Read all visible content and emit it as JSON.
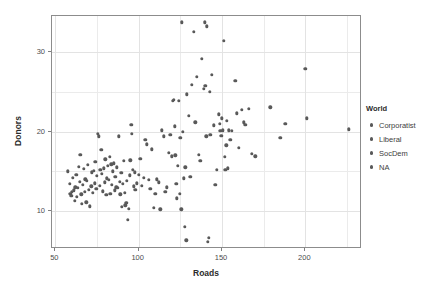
{
  "chart_data": {
    "type": "scatter",
    "title": "",
    "xlabel": "Roads",
    "ylabel": "Donors",
    "xlim": [
      48,
      234
    ],
    "ylim": [
      5.2,
      34.6
    ],
    "xticks": [
      50,
      100,
      150,
      200
    ],
    "yticks": [
      10,
      20,
      30
    ],
    "xticklabels": [
      "50",
      "100",
      "150",
      "200"
    ],
    "yticklabels": [
      "10",
      "20",
      "30"
    ],
    "grid": true,
    "grid_color": "#ebebeb",
    "point_color": "#595959",
    "panel_border_color": "#8c8c8c",
    "legend": {
      "title": "World",
      "position": "right",
      "entries": [
        {
          "label": "Corporatist",
          "color": "#595959"
        },
        {
          "label": "Liberal",
          "color": "#595959"
        },
        {
          "label": "SocDem",
          "color": "#595959"
        },
        {
          "label": "NA",
          "color": "#595959"
        }
      ]
    },
    "points": [
      [
        57.5,
        15.0
      ],
      [
        58.5,
        13.4
      ],
      [
        59.0,
        12.2
      ],
      [
        59.5,
        11.9
      ],
      [
        60.0,
        12.4
      ],
      [
        60.5,
        14.2
      ],
      [
        61.0,
        12.6
      ],
      [
        61.5,
        11.3
      ],
      [
        62.0,
        13.0
      ],
      [
        62.5,
        14.6
      ],
      [
        63.0,
        11.8
      ],
      [
        63.5,
        12.9
      ],
      [
        64.0,
        15.6
      ],
      [
        64.5,
        13.7
      ],
      [
        65.0,
        17.1
      ],
      [
        65.5,
        12.1
      ],
      [
        66.0,
        10.9
      ],
      [
        66.5,
        13.3
      ],
      [
        67.0,
        15.3
      ],
      [
        67.5,
        12.4
      ],
      [
        68.0,
        14.0
      ],
      [
        68.5,
        11.1
      ],
      [
        69.0,
        13.8
      ],
      [
        69.5,
        15.8
      ],
      [
        70.0,
        12.7
      ],
      [
        70.5,
        10.6
      ],
      [
        71.5,
        13.1
      ],
      [
        72.0,
        14.9
      ],
      [
        72.5,
        12.3
      ],
      [
        73.0,
        15.1
      ],
      [
        73.5,
        13.5
      ],
      [
        74.0,
        16.2
      ],
      [
        74.5,
        12.8
      ],
      [
        75.0,
        14.4
      ],
      [
        75.5,
        19.7
      ],
      [
        76.0,
        19.4
      ],
      [
        76.5,
        13.2
      ],
      [
        77.0,
        15.2
      ],
      [
        77.5,
        17.7
      ],
      [
        78.0,
        14.7
      ],
      [
        78.5,
        12.5
      ],
      [
        79.0,
        15.4
      ],
      [
        79.5,
        13.6
      ],
      [
        80.0,
        16.5
      ],
      [
        80.5,
        12.0
      ],
      [
        81.0,
        14.1
      ],
      [
        81.5,
        15.7
      ],
      [
        82.0,
        13.9
      ],
      [
        82.5,
        16.8
      ],
      [
        83.0,
        12.2
      ],
      [
        83.5,
        15.9
      ],
      [
        84.0,
        13.3
      ],
      [
        84.5,
        15.0
      ],
      [
        85.0,
        16.0
      ],
      [
        85.5,
        12.6
      ],
      [
        86.0,
        14.3
      ],
      [
        86.5,
        13.0
      ],
      [
        87.0,
        15.5
      ],
      [
        87.5,
        12.9
      ],
      [
        88.0,
        19.4
      ],
      [
        88.5,
        13.7
      ],
      [
        89.0,
        12.1
      ],
      [
        89.5,
        14.8
      ],
      [
        90.0,
        10.5
      ],
      [
        90.5,
        13.4
      ],
      [
        91.0,
        16.3
      ],
      [
        91.5,
        12.3
      ],
      [
        92.0,
        10.7
      ],
      [
        92.5,
        11.0
      ],
      [
        93.0,
        13.8
      ],
      [
        93.5,
        8.9
      ],
      [
        94.0,
        10.3
      ],
      [
        94.5,
        14.5
      ],
      [
        95.0,
        16.4
      ],
      [
        95.5,
        20.9
      ],
      [
        96.0,
        19.7
      ],
      [
        96.5,
        15.2
      ],
      [
        97.0,
        13.1
      ],
      [
        97.5,
        14.9
      ],
      [
        98.0,
        12.7
      ],
      [
        99.0,
        13.5
      ],
      [
        100.0,
        14.6
      ],
      [
        101.0,
        16.6
      ],
      [
        102.0,
        13.2
      ],
      [
        103.0,
        14.2
      ],
      [
        104.0,
        19.0
      ],
      [
        105.0,
        18.4
      ],
      [
        106.0,
        13.9
      ],
      [
        107.0,
        12.8
      ],
      [
        108.0,
        17.8
      ],
      [
        109.0,
        10.4
      ],
      [
        110.0,
        12.2
      ],
      [
        111.0,
        14.0
      ],
      [
        112.0,
        13.6
      ],
      [
        113.0,
        10.2
      ],
      [
        114.0,
        20.2
      ],
      [
        115.0,
        19.4
      ],
      [
        116.0,
        12.4
      ],
      [
        117.0,
        13.0
      ],
      [
        118.0,
        17.3
      ],
      [
        119.0,
        19.6
      ],
      [
        120.0,
        16.9
      ],
      [
        120.5,
        23.9
      ],
      [
        121.0,
        24.0
      ],
      [
        121.5,
        20.7
      ],
      [
        122.0,
        17.0
      ],
      [
        122.5,
        13.4
      ],
      [
        123.0,
        11.6
      ],
      [
        123.5,
        15.7
      ],
      [
        124.0,
        23.9
      ],
      [
        124.5,
        12.2
      ],
      [
        125.0,
        19.2
      ],
      [
        125.5,
        10.2
      ],
      [
        126.0,
        33.8
      ],
      [
        126.5,
        20.0
      ],
      [
        127.0,
        14.1
      ],
      [
        127.5,
        8.0
      ],
      [
        128.0,
        15.5
      ],
      [
        128.5,
        6.3
      ],
      [
        129.0,
        24.7
      ],
      [
        130.0,
        22.0
      ],
      [
        131.0,
        14.3
      ],
      [
        132.0,
        25.9
      ],
      [
        133.0,
        32.6
      ],
      [
        134.0,
        21.2
      ],
      [
        135.0,
        26.9
      ],
      [
        136.0,
        17.1
      ],
      [
        137.0,
        16.3
      ],
      [
        138.0,
        29.2
      ],
      [
        139.0,
        25.4
      ],
      [
        139.5,
        33.8
      ],
      [
        140.0,
        25.8
      ],
      [
        140.5,
        19.4
      ],
      [
        141.0,
        33.3
      ],
      [
        141.5,
        6.1
      ],
      [
        142.0,
        6.6
      ],
      [
        142.5,
        25.0
      ],
      [
        143.0,
        19.6
      ],
      [
        144.0,
        27.2
      ],
      [
        145.0,
        20.8
      ],
      [
        146.0,
        13.3
      ],
      [
        147.0,
        15.2
      ],
      [
        148.0,
        22.2
      ],
      [
        148.5,
        21.0
      ],
      [
        149.0,
        20.1
      ],
      [
        149.5,
        19.5
      ],
      [
        150.0,
        21.7
      ],
      [
        150.5,
        20.2
      ],
      [
        151.0,
        31.5
      ],
      [
        151.5,
        16.8
      ],
      [
        152.0,
        15.2
      ],
      [
        152.5,
        18.3
      ],
      [
        153.0,
        21.4
      ],
      [
        153.5,
        15.4
      ],
      [
        154.0,
        20.2
      ],
      [
        155.0,
        19.0
      ],
      [
        156.0,
        20.1
      ],
      [
        158.0,
        26.4
      ],
      [
        159.0,
        22.3
      ],
      [
        160.0,
        18.0
      ],
      [
        162.0,
        22.8
      ],
      [
        163.0,
        21.2
      ],
      [
        164.0,
        20.9
      ],
      [
        166.0,
        22.9
      ],
      [
        168.0,
        17.2
      ],
      [
        170.0,
        16.9
      ],
      [
        179.0,
        23.1
      ],
      [
        185.0,
        19.2
      ],
      [
        188.0,
        21.0
      ],
      [
        200.0,
        27.9
      ],
      [
        201.0,
        21.7
      ],
      [
        226.0,
        20.3
      ]
    ]
  }
}
